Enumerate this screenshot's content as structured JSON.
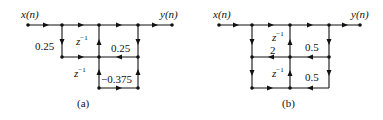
{
  "figure_a": {
    "caption": "(a)",
    "input_label": "x(n)",
    "output_label": "y(n)",
    "gains": {
      "left_branch": "0.25",
      "upper_delay": "z",
      "upper_delay_exp": "−1",
      "right_feedback": "0.25",
      "lower_delay": "z",
      "lower_delay_exp": "−1",
      "lower_feedback": "−0.375"
    }
  },
  "figure_b": {
    "caption": "(b)",
    "input_label": "x(n)",
    "output_label": "y(n)",
    "gains": {
      "upper_delay": "z",
      "upper_delay_exp": "−1",
      "left_gain": "2",
      "upper_right": "0.5",
      "lower_delay": "z",
      "lower_delay_exp": "−1",
      "lower_right": "0.5"
    }
  },
  "colors": {
    "line": "#111111",
    "background": "#ffffff"
  }
}
